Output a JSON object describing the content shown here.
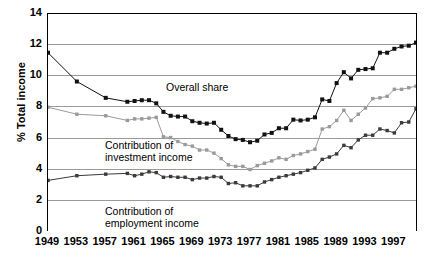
{
  "chart_data": {
    "type": "line",
    "title": "",
    "subtitle": "",
    "xlabel": "",
    "ylabel": "% Total income",
    "xlim": [
      1949,
      2000
    ],
    "ylim": [
      0,
      14
    ],
    "ytick_interval": 2,
    "yticks": [
      0,
      2,
      4,
      6,
      8,
      10,
      12,
      14
    ],
    "yticklabels": [
      "0",
      "2",
      "4",
      "6",
      "8",
      "10",
      "12",
      "14"
    ],
    "y_minor_tick_interval": 1,
    "xticks": [
      1949,
      1953,
      1957,
      1961,
      1965,
      1969,
      1973,
      1977,
      1981,
      1985,
      1989,
      1993,
      1997
    ],
    "xticklabels": [
      "1949",
      "1953",
      "1957",
      "1961",
      "1965",
      "1969",
      "1973",
      "1977",
      "1981",
      "1985",
      "1989",
      "1993",
      "1997"
    ],
    "x_minor_tick_interval": 1,
    "grid": true,
    "grid_axis": "y",
    "grid_color": "#9a9a9a",
    "legend": "in-plot annotations",
    "legend_position": "none",
    "x": [
      1949,
      1953,
      1957,
      1960,
      1961,
      1962,
      1963,
      1964,
      1965,
      1966,
      1967,
      1968,
      1969,
      1970,
      1971,
      1972,
      1973,
      1974,
      1975,
      1976,
      1977,
      1978,
      1979,
      1980,
      1981,
      1982,
      1983,
      1984,
      1985,
      1986,
      1987,
      1988,
      1989,
      1990,
      1991,
      1992,
      1993,
      1994,
      1995,
      1996,
      1997,
      1998,
      1999,
      2000
    ],
    "series": [
      {
        "name": "Overall share",
        "color": "#111111",
        "marker": "square",
        "values": [
          11.45,
          9.6,
          8.55,
          8.3,
          8.35,
          8.4,
          8.4,
          8.2,
          7.65,
          7.4,
          7.35,
          7.35,
          7.05,
          6.95,
          6.9,
          6.95,
          6.5,
          6.1,
          5.9,
          5.85,
          5.7,
          5.8,
          6.2,
          6.3,
          6.6,
          6.6,
          7.15,
          7.1,
          7.15,
          7.3,
          8.45,
          8.35,
          9.5,
          10.2,
          9.8,
          10.35,
          10.4,
          10.45,
          11.45,
          11.45,
          11.7,
          11.85,
          11.9,
          12.1
        ]
      },
      {
        "name": "Contribution of investment income",
        "color": "#9a9a9a",
        "marker": "square",
        "values": [
          7.95,
          7.5,
          7.4,
          7.1,
          7.2,
          7.2,
          7.25,
          7.3,
          6.05,
          6.0,
          5.75,
          5.55,
          5.45,
          5.2,
          5.2,
          5.0,
          4.65,
          4.25,
          4.15,
          4.15,
          3.95,
          4.2,
          4.35,
          4.5,
          4.7,
          4.6,
          4.85,
          4.95,
          5.1,
          5.25,
          6.55,
          6.7,
          7.1,
          7.75,
          7.1,
          7.5,
          7.9,
          8.5,
          8.55,
          8.65,
          9.1,
          9.1,
          9.2,
          9.3
        ]
      },
      {
        "name": "Contribution of employment income",
        "color": "#3a3a3a",
        "marker": "square",
        "values": [
          3.25,
          3.55,
          3.65,
          3.7,
          3.55,
          3.65,
          3.8,
          3.75,
          3.45,
          3.5,
          3.45,
          3.45,
          3.3,
          3.4,
          3.4,
          3.5,
          3.45,
          3.05,
          3.1,
          2.9,
          2.9,
          2.9,
          3.15,
          3.3,
          3.45,
          3.55,
          3.65,
          3.75,
          3.9,
          4.05,
          4.6,
          4.75,
          4.95,
          5.5,
          5.35,
          5.85,
          6.15,
          6.15,
          6.55,
          6.45,
          6.3,
          6.95,
          7.0,
          7.85
        ]
      }
    ],
    "annotations": [
      {
        "id": "overall",
        "text": "Overall share"
      },
      {
        "id": "investment",
        "text": "Contribution of\ninvestment income"
      },
      {
        "id": "employment",
        "text": "Contribution of\nemployment income"
      }
    ]
  }
}
